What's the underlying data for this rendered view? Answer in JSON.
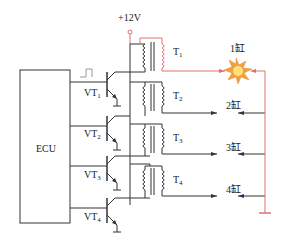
{
  "supply": {
    "label": "+12V"
  },
  "ecu": {
    "label": "ECU"
  },
  "transistors": [
    {
      "label": "VT",
      "sub": "1"
    },
    {
      "label": "VT",
      "sub": "2"
    },
    {
      "label": "VT",
      "sub": "3"
    },
    {
      "label": "VT",
      "sub": "4"
    }
  ],
  "transformers": [
    {
      "label": "T",
      "sub": "1"
    },
    {
      "label": "T",
      "sub": "2"
    },
    {
      "label": "T",
      "sub": "3"
    },
    {
      "label": "T",
      "sub": "4"
    }
  ],
  "cylinders": [
    {
      "label": "1缸",
      "state": "firing"
    },
    {
      "label": "2缸"
    },
    {
      "label": "3缸"
    },
    {
      "label": "4缸"
    }
  ],
  "colors": {
    "wire": "#333333",
    "active_path": "#e0706c",
    "spark_outer": "#f0a040",
    "spark_inner": "#ffe27a"
  }
}
